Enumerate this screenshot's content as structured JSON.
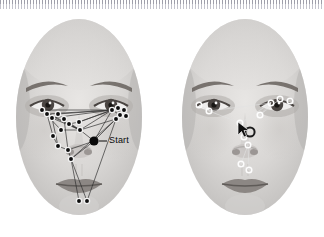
{
  "figure": {
    "width": 324,
    "height": 237,
    "background_color": "#ffffff"
  },
  "ruler": {
    "name": "tick-ruler-strip",
    "position": "top",
    "tick_color": "#9a9aa6",
    "tick_spacing_px": 3
  },
  "panels": [
    {
      "id": "left",
      "label": "left-face-panel",
      "marker_style": "filled-black-dot-with-white-ring",
      "marker_fill": "#0d0d0d",
      "marker_ring": "#f2f2f2",
      "edge_color": "#2b2b2b",
      "annotation": {
        "text": "Start",
        "color": "#0a0a0a",
        "x": 103,
        "y": 122,
        "leader_from_x": 96,
        "leader_from_y": 123,
        "anchor_node": "start-node"
      },
      "start_node": {
        "x": 88,
        "y": 123,
        "r": 4.6
      },
      "nodes": [
        {
          "id": "L1",
          "x": 36,
          "y": 92
        },
        {
          "id": "L2",
          "x": 41,
          "y": 96
        },
        {
          "id": "L3",
          "x": 46,
          "y": 100
        },
        {
          "id": "L4",
          "x": 52,
          "y": 96
        },
        {
          "id": "L5",
          "x": 58,
          "y": 101
        },
        {
          "id": "L6",
          "x": 63,
          "y": 106
        },
        {
          "id": "L7",
          "x": 55,
          "y": 112
        },
        {
          "id": "L8",
          "x": 47,
          "y": 118
        },
        {
          "id": "L9",
          "x": 52,
          "y": 128
        },
        {
          "id": "L10",
          "x": 62,
          "y": 132
        },
        {
          "id": "L11",
          "x": 65,
          "y": 141
        },
        {
          "id": "L12",
          "x": 74,
          "y": 112
        },
        {
          "id": "L13",
          "x": 73,
          "y": 104
        },
        {
          "id": "L14",
          "x": 106,
          "y": 92
        },
        {
          "id": "L15",
          "x": 112,
          "y": 90
        },
        {
          "id": "L16",
          "x": 118,
          "y": 92
        },
        {
          "id": "L17",
          "x": 114,
          "y": 97
        },
        {
          "id": "L18",
          "x": 120,
          "y": 98
        },
        {
          "id": "L19",
          "x": 110,
          "y": 101
        },
        {
          "id": "L20",
          "x": 73,
          "y": 183
        },
        {
          "id": "L21",
          "x": 81,
          "y": 183
        }
      ],
      "edges": [
        [
          "L1",
          "L14"
        ],
        [
          "L2",
          "L14"
        ],
        [
          "L3",
          "L14"
        ],
        [
          "L4",
          "L14"
        ],
        [
          "L1",
          "L12"
        ],
        [
          "L2",
          "L12"
        ],
        [
          "L3",
          "L12"
        ],
        [
          "L5",
          "L12"
        ],
        [
          "L6",
          "L13"
        ],
        [
          "L6",
          "L12"
        ],
        [
          "L13",
          "L14"
        ],
        [
          "L13",
          "L15"
        ],
        [
          "L12",
          "L14"
        ],
        [
          "L12",
          "L19"
        ],
        [
          "L1",
          "L7"
        ],
        [
          "L2",
          "L8"
        ],
        [
          "L3",
          "L9"
        ],
        [
          "L5",
          "L10"
        ],
        [
          "L7",
          "L12"
        ],
        [
          "L8",
          "L9"
        ],
        [
          "L9",
          "L10"
        ],
        [
          "L10",
          "L11"
        ],
        [
          "L11",
          "L20"
        ],
        [
          "L11",
          "L21"
        ],
        [
          "L14",
          "L17"
        ],
        [
          "L15",
          "L17"
        ],
        [
          "L16",
          "L18"
        ],
        [
          "L17",
          "L19"
        ],
        [
          "L19",
          "L11"
        ],
        [
          "L19",
          "L21"
        ],
        [
          "start-node",
          "L12"
        ],
        [
          "start-node",
          "L10"
        ],
        [
          "start-node",
          "L19"
        ],
        [
          "start-node",
          "L14"
        ],
        [
          "start-node",
          "L11"
        ]
      ]
    },
    {
      "id": "right",
      "label": "right-face-panel",
      "marker_style": "hollow-white-ring",
      "marker_fill": "none",
      "marker_ring": "#fdfdfd",
      "marker_ring_outer": "#3a3a3a",
      "edge_color": "#d8d8d8",
      "cursor": {
        "x": 57,
        "y": 50,
        "color": "#111111"
      },
      "dark_ring": {
        "x": 68,
        "y": 56,
        "r": 5.2,
        "color": "#1c1c1c"
      },
      "nodes": [
        {
          "id": "R1",
          "x": 27,
          "y": 33
        },
        {
          "id": "R2",
          "x": 37,
          "y": 39
        },
        {
          "id": "R3",
          "x": 99,
          "y": 31
        },
        {
          "id": "R4",
          "x": 108,
          "y": 27
        },
        {
          "id": "R5",
          "x": 118,
          "y": 29
        },
        {
          "id": "R6",
          "x": 55,
          "y": 48
        },
        {
          "id": "R7",
          "x": 62,
          "y": 62
        },
        {
          "id": "R8",
          "x": 66,
          "y": 70
        },
        {
          "id": "R9",
          "x": 59,
          "y": 89
        },
        {
          "id": "R10",
          "x": 67,
          "y": 95
        },
        {
          "id": "R11",
          "x": 88,
          "y": 43
        }
      ],
      "edges": [
        [
          "R2",
          "R3"
        ],
        [
          "R2",
          "R6"
        ],
        [
          "R3",
          "R6"
        ],
        [
          "R4",
          "R11"
        ],
        [
          "R6",
          "R7"
        ],
        [
          "R7",
          "R8"
        ],
        [
          "R8",
          "R9"
        ],
        [
          "R9",
          "R10"
        ],
        [
          "R1",
          "R2"
        ],
        [
          "R11",
          "R6"
        ],
        [
          "R8",
          "R10"
        ],
        [
          "R3",
          "R11"
        ]
      ]
    }
  ]
}
